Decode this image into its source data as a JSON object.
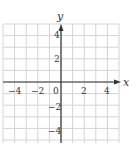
{
  "chart_data": {
    "type": "coordinate-grid",
    "title": "",
    "xlabel": "x",
    "ylabel": "y",
    "xlim": [
      -5,
      5
    ],
    "ylim": [
      -5,
      5
    ],
    "grid": true,
    "grid_step": 1,
    "x_tick_labels": [
      "-4",
      "-2",
      "0",
      "2",
      "4"
    ],
    "y_tick_labels": [
      "4",
      "2",
      "-2",
      "-4"
    ],
    "series": []
  },
  "labels": {
    "x_axis": "x",
    "y_axis": "y",
    "origin": "0",
    "x_neg4": "−4",
    "x_neg2": "−2",
    "x_2": "2",
    "x_4": "4",
    "y_4": "4",
    "y_2": "2",
    "y_neg2": "−2",
    "y_neg4": "−4"
  },
  "colors": {
    "grid": "#d4d4d4",
    "axis": "#333333",
    "text": "#333333"
  }
}
